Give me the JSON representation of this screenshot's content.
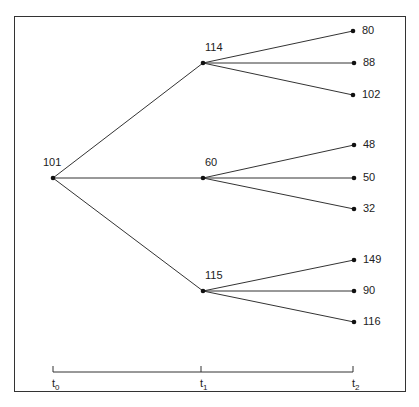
{
  "nodes": {
    "root": {
      "label": "101",
      "x": 53,
      "y": 178
    },
    "t1": [
      {
        "label": "114",
        "x": 203,
        "y": 63
      },
      {
        "label": "60",
        "x": 203,
        "y": 178
      },
      {
        "label": "115",
        "x": 203,
        "y": 291
      }
    ],
    "t2": [
      {
        "label": "80",
        "x": 353,
        "y": 31,
        "parent": 0
      },
      {
        "label": "88",
        "x": 354,
        "y": 63,
        "parent": 0
      },
      {
        "label": "102",
        "x": 353,
        "y": 95,
        "parent": 0
      },
      {
        "label": "48",
        "x": 354,
        "y": 145,
        "parent": 1
      },
      {
        "label": "50",
        "x": 354,
        "y": 178,
        "parent": 1
      },
      {
        "label": "32",
        "x": 354,
        "y": 209,
        "parent": 1
      },
      {
        "label": "149",
        "x": 354,
        "y": 260,
        "parent": 2
      },
      {
        "label": "90",
        "x": 354,
        "y": 291,
        "parent": 2
      },
      {
        "label": "116",
        "x": 354,
        "y": 322,
        "parent": 2
      }
    ]
  },
  "timeline": {
    "y": 372,
    "ticks": [
      {
        "base": "t",
        "sub": "0",
        "x": 53
      },
      {
        "base": "t",
        "sub": "1",
        "x": 201
      },
      {
        "base": "t",
        "sub": "2",
        "x": 353
      }
    ]
  }
}
